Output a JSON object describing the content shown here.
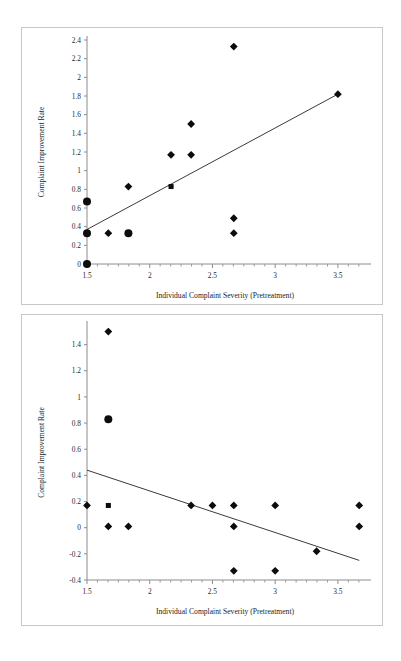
{
  "document": {
    "background_color": "#ffffff",
    "panel_border_color": "#c8c8c8",
    "figure_count": 2
  },
  "shared": {
    "xlabel": "Individual Complaint Severity (Pretreatment)",
    "ylabel": "Complaint Improvement Rate",
    "marker_color": "#0d0d0d",
    "trendline_color": "#3a3a3a",
    "axis_color": "#8c8c8c"
  },
  "chart_data": [
    {
      "id": "top-scatter",
      "type": "scatter",
      "title": "",
      "xlabel": "Individual Complaint Severity (Pretreatment)",
      "ylabel": "Complaint Improvement Rate",
      "xlim": [
        1.5,
        3.7
      ],
      "ylim": [
        0,
        2.4
      ],
      "xticks": [
        1.5,
        2,
        2.5,
        3,
        3.5
      ],
      "xtick_labels": [
        "1.5",
        "2",
        "2.5",
        "3",
        "3.5"
      ],
      "yticks": [
        0,
        0.2,
        0.4,
        0.6,
        0.8,
        1,
        1.2,
        1.4,
        1.6,
        1.8,
        2,
        2.2,
        2.4
      ],
      "ytick_labels": [
        "0",
        "0.2",
        "0.4",
        "0.6",
        "0.8",
        "1",
        "1.2",
        "1.4",
        "1.6",
        "1.8",
        "2",
        "2.2",
        "2.4"
      ],
      "grid": false,
      "legend": false,
      "minor_ticks_x": true,
      "points": [
        {
          "x": 1.5,
          "y": 0.67,
          "size": "large",
          "shape": "circle"
        },
        {
          "x": 1.5,
          "y": 0.33,
          "size": "large",
          "shape": "circle"
        },
        {
          "x": 1.5,
          "y": 0.0,
          "size": "large",
          "shape": "circle"
        },
        {
          "x": 1.67,
          "y": 0.33,
          "size": "small",
          "shape": "diamond"
        },
        {
          "x": 1.83,
          "y": 0.83,
          "size": "small",
          "shape": "diamond"
        },
        {
          "x": 1.83,
          "y": 0.33,
          "size": "large",
          "shape": "circle"
        },
        {
          "x": 2.17,
          "y": 1.17,
          "size": "small",
          "shape": "diamond"
        },
        {
          "x": 2.17,
          "y": 0.83,
          "size": "small",
          "shape": "square"
        },
        {
          "x": 2.33,
          "y": 1.5,
          "size": "small",
          "shape": "diamond"
        },
        {
          "x": 2.33,
          "y": 1.17,
          "size": "small",
          "shape": "diamond"
        },
        {
          "x": 2.67,
          "y": 2.33,
          "size": "small",
          "shape": "diamond"
        },
        {
          "x": 2.67,
          "y": 0.49,
          "size": "small",
          "shape": "diamond"
        },
        {
          "x": 2.67,
          "y": 0.33,
          "size": "small",
          "shape": "diamond"
        },
        {
          "x": 3.5,
          "y": 1.82,
          "size": "small",
          "shape": "diamond"
        }
      ],
      "trendline": {
        "x1": 1.5,
        "y1": 0.37,
        "x2": 3.5,
        "y2": 1.82,
        "slope_sign": "positive"
      }
    },
    {
      "id": "bottom-scatter",
      "type": "scatter",
      "title": "",
      "xlabel": "Individual Complaint Severity (Pretreatment)",
      "ylabel": "Complaint Improvement Rate",
      "xlim": [
        1.5,
        3.7
      ],
      "ylim": [
        -0.4,
        1.55
      ],
      "xticks": [
        1.5,
        2,
        2.5,
        3,
        3.5
      ],
      "xtick_labels": [
        "1.5",
        "2",
        "2.5",
        "3",
        "3.5"
      ],
      "yticks": [
        -0.4,
        -0.2,
        0,
        0.2,
        0.4,
        0.6,
        0.8,
        1,
        1.2,
        1.4
      ],
      "ytick_labels": [
        "-0.4",
        "-0.2",
        "0",
        "0.2",
        "0.4",
        "0.6",
        "0.8",
        "1",
        "1.2",
        "1.4"
      ],
      "grid": false,
      "legend": false,
      "minor_ticks_x": true,
      "points": [
        {
          "x": 1.5,
          "y": 0.17,
          "size": "small",
          "shape": "diamond"
        },
        {
          "x": 1.67,
          "y": 1.5,
          "size": "small",
          "shape": "diamond"
        },
        {
          "x": 1.67,
          "y": 0.83,
          "size": "large",
          "shape": "circle"
        },
        {
          "x": 1.67,
          "y": 0.17,
          "size": "small",
          "shape": "square"
        },
        {
          "x": 1.67,
          "y": 0.01,
          "size": "small",
          "shape": "diamond"
        },
        {
          "x": 1.83,
          "y": 0.01,
          "size": "small",
          "shape": "diamond"
        },
        {
          "x": 2.33,
          "y": 0.17,
          "size": "small",
          "shape": "diamond"
        },
        {
          "x": 2.5,
          "y": 0.17,
          "size": "small",
          "shape": "diamond"
        },
        {
          "x": 2.67,
          "y": 0.17,
          "size": "small",
          "shape": "diamond"
        },
        {
          "x": 2.67,
          "y": 0.01,
          "size": "small",
          "shape": "diamond"
        },
        {
          "x": 2.67,
          "y": -0.33,
          "size": "small",
          "shape": "diamond"
        },
        {
          "x": 3.0,
          "y": 0.17,
          "size": "small",
          "shape": "diamond"
        },
        {
          "x": 3.0,
          "y": -0.33,
          "size": "small",
          "shape": "diamond"
        },
        {
          "x": 3.33,
          "y": -0.18,
          "size": "small",
          "shape": "diamond"
        },
        {
          "x": 3.67,
          "y": 0.17,
          "size": "small",
          "shape": "diamond"
        },
        {
          "x": 3.67,
          "y": 0.01,
          "size": "small",
          "shape": "diamond"
        }
      ],
      "trendline": {
        "x1": 1.5,
        "y1": 0.44,
        "x2": 3.67,
        "y2": -0.25,
        "slope_sign": "negative"
      }
    }
  ]
}
